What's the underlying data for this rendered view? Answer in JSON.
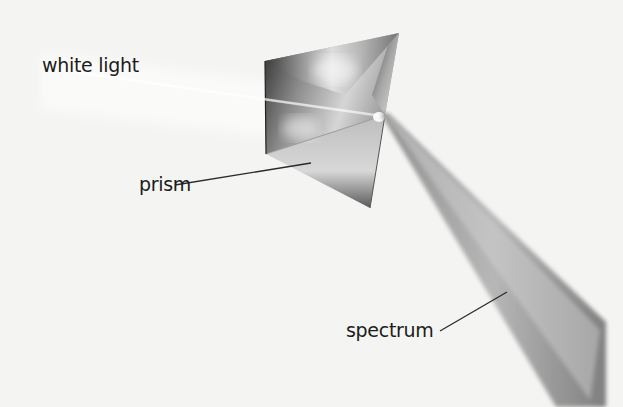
{
  "diagram": {
    "labels": {
      "white_light": "white light",
      "prism": "prism",
      "spectrum": "spectrum"
    },
    "colors": {
      "background": "#f4f4f3",
      "text": "#1c1c1c",
      "leader_line": "#2a2a2a"
    }
  }
}
